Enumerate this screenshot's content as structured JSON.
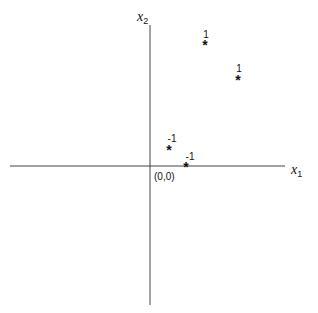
{
  "diagram": {
    "axes": {
      "x": {
        "label": "x",
        "subscript": "1"
      },
      "y": {
        "label": "x",
        "subscript": "2"
      },
      "origin_label": "(0,0)"
    },
    "points": [
      {
        "marker": "*",
        "label": "1",
        "class": "positive",
        "px": 205,
        "py": 45
      },
      {
        "marker": "*",
        "label": "1",
        "class": "positive",
        "px": 238,
        "py": 80
      },
      {
        "marker": "*",
        "label": "-1",
        "class": "negative",
        "px": 169,
        "py": 150
      },
      {
        "marker": "*",
        "label": "-1",
        "class": "negative",
        "px": 186,
        "py": 167
      }
    ],
    "colors": {
      "axis": "#444444",
      "text": "#111111",
      "background": "#ffffff"
    }
  }
}
